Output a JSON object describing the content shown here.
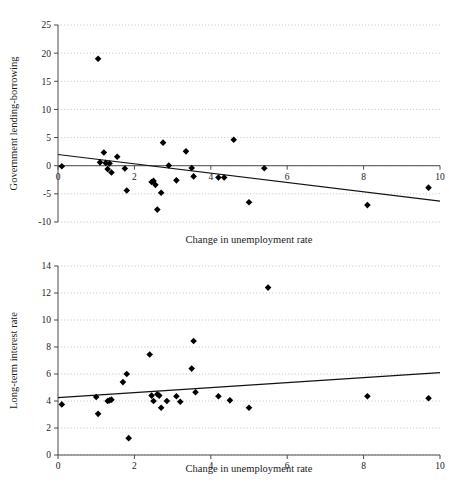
{
  "chart_data": [
    {
      "id": "government-lending-borrowing",
      "type": "scatter",
      "title": "",
      "xlabel": "Change in unemployment rate",
      "ylabel": "Government lending-borrowing",
      "xlim": [
        0,
        10
      ],
      "ylim": [
        -10,
        25
      ],
      "xticks": [
        0,
        2,
        4,
        6,
        8,
        10
      ],
      "xtick_labels": [
        "0",
        "2",
        "4",
        "6",
        "8",
        "10"
      ],
      "yticks": [
        -10,
        -5,
        0,
        5,
        10,
        15,
        20,
        25
      ],
      "ytick_labels": [
        "-10",
        "-5",
        "0",
        "5",
        "10",
        "15",
        "20",
        "25"
      ],
      "grid": true,
      "grid_axis": "y",
      "legend": "none",
      "marker": "diamond",
      "marker_color": "#000000",
      "points": [
        {
          "x": 0.1,
          "y": -0.1
        },
        {
          "x": 1.05,
          "y": 19.0
        },
        {
          "x": 1.1,
          "y": 0.6
        },
        {
          "x": 1.2,
          "y": 2.35
        },
        {
          "x": 1.25,
          "y": 0.5
        },
        {
          "x": 1.3,
          "y": -0.6
        },
        {
          "x": 1.35,
          "y": 0.4
        },
        {
          "x": 1.4,
          "y": -1.2
        },
        {
          "x": 1.55,
          "y": 1.6
        },
        {
          "x": 1.75,
          "y": -0.5
        },
        {
          "x": 1.8,
          "y": -4.4
        },
        {
          "x": 2.45,
          "y": -2.9
        },
        {
          "x": 2.5,
          "y": -2.7
        },
        {
          "x": 2.55,
          "y": -3.4
        },
        {
          "x": 2.6,
          "y": -7.8
        },
        {
          "x": 2.7,
          "y": -4.8
        },
        {
          "x": 2.75,
          "y": 4.1
        },
        {
          "x": 2.9,
          "y": 0.05
        },
        {
          "x": 3.1,
          "y": -2.6
        },
        {
          "x": 3.35,
          "y": 2.55
        },
        {
          "x": 3.5,
          "y": -0.4
        },
        {
          "x": 3.55,
          "y": -1.9
        },
        {
          "x": 4.2,
          "y": -2.1
        },
        {
          "x": 4.35,
          "y": -2.1
        },
        {
          "x": 4.6,
          "y": 4.6
        },
        {
          "x": 5.0,
          "y": -6.5
        },
        {
          "x": 5.4,
          "y": -0.45
        },
        {
          "x": 8.1,
          "y": -7.0
        },
        {
          "x": 9.7,
          "y": -3.9
        }
      ],
      "trendline": {
        "x0": 0.0,
        "y0": 2.0,
        "x1": 10.0,
        "y1": -6.3
      }
    },
    {
      "id": "long-term-interest-rate",
      "type": "scatter",
      "title": "",
      "xlabel": "Change in unemployment rate",
      "ylabel": "Long-term interest rate",
      "xlim": [
        0,
        10
      ],
      "ylim": [
        0,
        14
      ],
      "xticks": [
        0,
        2,
        4,
        6,
        8,
        10
      ],
      "xtick_labels": [
        "0",
        "2",
        "4",
        "6",
        "8",
        "10"
      ],
      "yticks": [
        0,
        2,
        4,
        6,
        8,
        10,
        12,
        14
      ],
      "ytick_labels": [
        "0",
        "2",
        "4",
        "6",
        "8",
        "10",
        "12",
        "14"
      ],
      "grid": true,
      "grid_axis": "y",
      "legend": "none",
      "marker": "diamond",
      "marker_color": "#000000",
      "points": [
        {
          "x": 0.1,
          "y": 3.75
        },
        {
          "x": 1.0,
          "y": 4.3
        },
        {
          "x": 1.05,
          "y": 3.05
        },
        {
          "x": 1.3,
          "y": 4.0
        },
        {
          "x": 1.35,
          "y": 4.05
        },
        {
          "x": 1.4,
          "y": 4.1
        },
        {
          "x": 1.7,
          "y": 5.4
        },
        {
          "x": 1.8,
          "y": 6.0
        },
        {
          "x": 1.85,
          "y": 1.25
        },
        {
          "x": 2.4,
          "y": 7.45
        },
        {
          "x": 2.45,
          "y": 4.4
        },
        {
          "x": 2.5,
          "y": 4.0
        },
        {
          "x": 2.6,
          "y": 4.5
        },
        {
          "x": 2.65,
          "y": 4.4
        },
        {
          "x": 2.7,
          "y": 3.5
        },
        {
          "x": 2.85,
          "y": 4.0
        },
        {
          "x": 3.1,
          "y": 4.35
        },
        {
          "x": 3.2,
          "y": 3.95
        },
        {
          "x": 3.5,
          "y": 6.4
        },
        {
          "x": 3.55,
          "y": 8.45
        },
        {
          "x": 3.6,
          "y": 4.65
        },
        {
          "x": 4.2,
          "y": 4.35
        },
        {
          "x": 4.5,
          "y": 4.05
        },
        {
          "x": 5.0,
          "y": 3.5
        },
        {
          "x": 5.5,
          "y": 12.4
        },
        {
          "x": 8.1,
          "y": 4.35
        },
        {
          "x": 9.7,
          "y": 4.2
        }
      ],
      "trendline": {
        "x0": 0.0,
        "y0": 4.25,
        "x1": 10.0,
        "y1": 6.1
      }
    }
  ]
}
